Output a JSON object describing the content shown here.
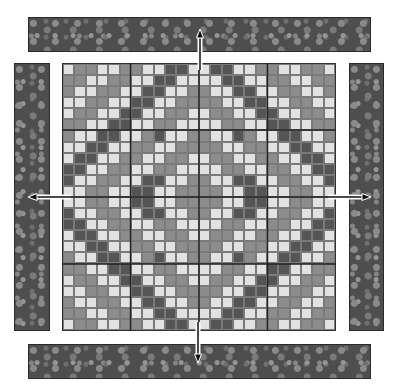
{
  "diagram": {
    "colors": {
      "L": "#e2e2e2",
      "M": "#8c8c8c",
      "D": "#555555",
      "border_fabric": "#4e4e4e",
      "background": "#ffffff"
    },
    "grid": {
      "columns": 24,
      "rows": 24,
      "blocks_per_side": 4,
      "cells_per_block": 6,
      "quadrant_top_left": [
        "LMMLLMMLLDDL",
        "MMLLMMLLDDLL",
        "MLLMMLLDDLLM",
        "LLMMLLDDLLMM",
        "LMMLLDDLLMML",
        "MMLLDDLLMMLL",
        "MLLDDLLMDLLM",
        "LLDDLLMMLLMM",
        "LDDLLMMLLMML",
        "DDLLMMLLMMLL",
        "DLLMMLLDDLLM",
        "LLMMLLDDLLMM"
      ]
    },
    "borders": [
      {
        "name": "top-border",
        "label": "Top border strip"
      },
      {
        "name": "left-border",
        "label": "Left border strip"
      },
      {
        "name": "right-border",
        "label": "Right border strip"
      },
      {
        "name": "bottom-border",
        "label": "Bottom border strip"
      }
    ],
    "arrows": [
      {
        "name": "arrow-up",
        "direction": "up"
      },
      {
        "name": "arrow-left",
        "direction": "left"
      },
      {
        "name": "arrow-right",
        "direction": "right"
      },
      {
        "name": "arrow-down",
        "direction": "down"
      }
    ],
    "caption": ""
  }
}
